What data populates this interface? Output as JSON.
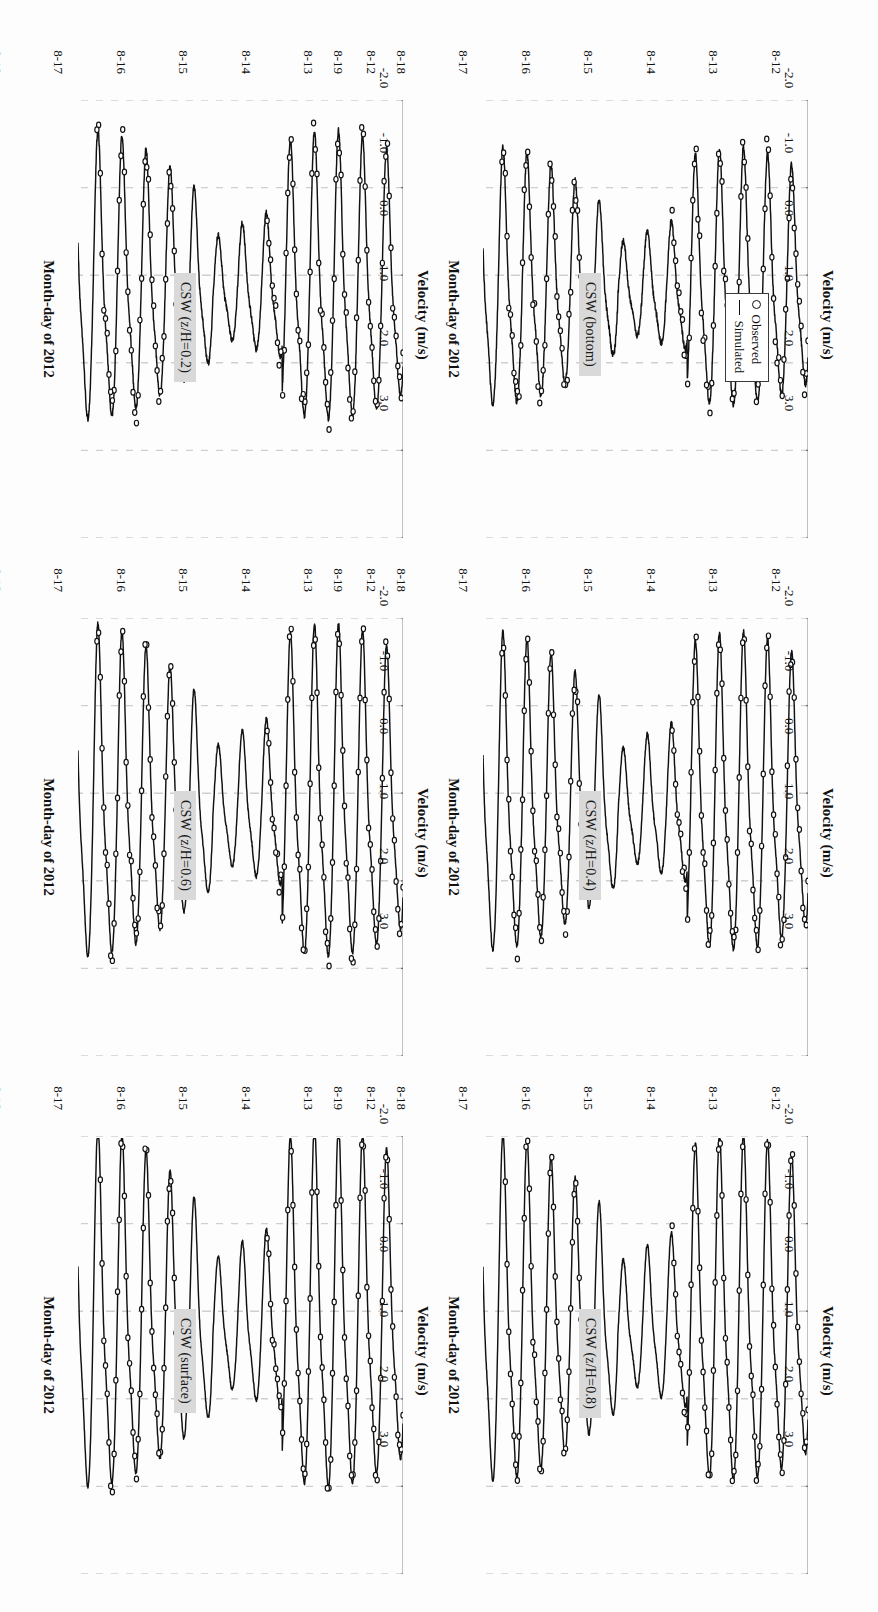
{
  "figure": {
    "axis": {
      "y_title": "Velocity (m/s)",
      "x_title": "Month-day of 2012",
      "y_ticks": [
        "-2.0",
        "-1.0",
        "0.0",
        "1.0",
        "2.0",
        "3.0"
      ],
      "y_values": [
        -2.0,
        -1.0,
        0.0,
        1.0,
        2.0,
        3.0
      ],
      "x_ticks": [
        "8-12",
        "8-13",
        "8-14",
        "8-15",
        "8-16",
        "8-17",
        "8-18",
        "8-19"
      ],
      "ylim": [
        -2.0,
        3.0
      ],
      "grid": "dashed-gray"
    },
    "legend": {
      "observed_label": "Observed",
      "simulated_label": "Simulated",
      "observed_marker": "open-circle",
      "simulated_marker": "solid-line",
      "position": "panel-1-right"
    },
    "colors": {
      "line": "#111111",
      "marker_stroke": "#111111",
      "grid": "#cfcfcf",
      "tag_background": "#d9d9d9",
      "page_background": "#fdfdfd"
    },
    "panels": [
      {
        "id": "csw-bottom",
        "tag": "CSW (bottom)",
        "has_legend": true,
        "seed": 11,
        "obs_end": 0.74,
        "amp": 1.05,
        "noise": 0.22
      },
      {
        "id": "csw-zh-04",
        "tag": "CSW (z/H=0.4)",
        "has_legend": false,
        "seed": 23,
        "obs_end": 0.74,
        "amp": 1.3,
        "noise": 0.16
      },
      {
        "id": "csw-zh-08",
        "tag": "CSW (z/H=0.8)",
        "has_legend": false,
        "seed": 37,
        "obs_end": 0.74,
        "amp": 1.42,
        "noise": 0.13
      },
      {
        "id": "csw-zh-02",
        "tag": "CSW (z/H=0.2)",
        "has_legend": false,
        "seed": 51,
        "obs_end": 0.74,
        "amp": 1.18,
        "noise": 0.19
      },
      {
        "id": "csw-zh-06",
        "tag": "CSW (z/H=0.6)",
        "has_legend": false,
        "seed": 67,
        "obs_end": 0.74,
        "amp": 1.36,
        "noise": 0.14
      },
      {
        "id": "csw-surface",
        "tag": "CSW (surface)",
        "has_legend": false,
        "seed": 83,
        "obs_end": 0.74,
        "amp": 1.48,
        "noise": 0.12
      }
    ]
  },
  "chart_data": {
    "type": "line",
    "title": "",
    "xlabel": "Month-day of 2012",
    "ylabel": "Velocity (m/s)",
    "ylim": [
      -2.0,
      3.0
    ],
    "xlim": [
      "8-12",
      "8-19"
    ],
    "grid": true,
    "legend": [
      "Observed",
      "Simulated"
    ],
    "legend_position": "top-right of first panel",
    "panel_count": 6,
    "panel_titles": [
      "CSW (bottom)",
      "CSW (z/H=0.2)",
      "CSW (z/H=0.4)",
      "CSW (z/H=0.6)",
      "CSW (z/H=0.8)",
      "CSW (surface)"
    ],
    "x_tick_labels": [
      "8-12",
      "8-13",
      "8-14",
      "8-15",
      "8-16",
      "8-17",
      "8-18",
      "8-19"
    ],
    "y_tick_labels": [
      "-2.0",
      "-1.0",
      "0.0",
      "1.0",
      "2.0",
      "3.0"
    ],
    "series_description": "Tidal velocity oscillation, roughly semi-diurnal (two cycles per day), spring-neap modulation: large amplitude near 8-12 to 8-14 and 8-16 to 8-19, reduced amplitude near 8-15. Observed points (open circles) available only over 8-12 to 8-15 and 8-17 to 8-19.",
    "series": [
      {
        "name": "Simulated",
        "marker": "line",
        "panels": [
          {
            "panel": "CSW (bottom)",
            "peak_max": 1.6,
            "peak_min": -1.5,
            "cycles_per_day": 2
          },
          {
            "panel": "CSW (z/H=0.2)",
            "peak_max": 1.9,
            "peak_min": -1.6,
            "cycles_per_day": 2
          },
          {
            "panel": "CSW (z/H=0.4)",
            "peak_max": 2.1,
            "peak_min": -1.7,
            "cycles_per_day": 2
          },
          {
            "panel": "CSW (z/H=0.6)",
            "peak_max": 2.2,
            "peak_min": -1.75,
            "cycles_per_day": 2
          },
          {
            "panel": "CSW (z/H=0.8)",
            "peak_max": 2.3,
            "peak_min": -1.8,
            "cycles_per_day": 2
          },
          {
            "panel": "CSW (surface)",
            "peak_max": 2.4,
            "peak_min": -1.85,
            "cycles_per_day": 2
          }
        ]
      },
      {
        "name": "Observed",
        "marker": "open-circle",
        "coverage": [
          "8-12 to 8-15",
          "8-17 to 8-19"
        ]
      }
    ]
  }
}
